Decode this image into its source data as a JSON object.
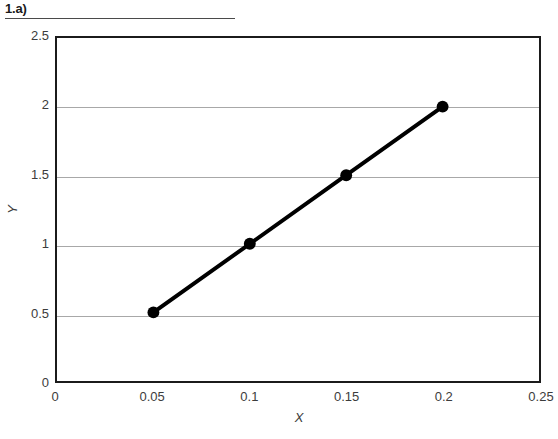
{
  "header": {
    "label": "1.a)"
  },
  "chart_data": {
    "type": "line",
    "title": "",
    "xlabel": "X",
    "ylabel": "Y",
    "x": [
      0.05,
      0.1,
      0.15,
      0.2
    ],
    "values": [
      0.5,
      1,
      1.5,
      2
    ],
    "series": [
      {
        "name": "",
        "x": [
          0.05,
          0.1,
          0.15,
          0.2
        ],
        "values": [
          0.5,
          1,
          1.5,
          2
        ]
      }
    ],
    "xlim": [
      0,
      0.25
    ],
    "ylim": [
      0,
      2.5
    ],
    "xticks": [
      0,
      0.05,
      0.1,
      0.15,
      0.2,
      0.25
    ],
    "xtick_labels": [
      "0",
      "0.05",
      "0.1",
      "0.15",
      "0.2",
      "0.25"
    ],
    "yticks": [
      0,
      0.5,
      1,
      1.5,
      2,
      2.5
    ],
    "ytick_labels": [
      "0",
      "0.5",
      "1",
      "1.5",
      "2",
      "2.5"
    ],
    "grid": "horizontal",
    "legend": "none",
    "marker": "filled-circle",
    "marker_color": "#000000",
    "line_color": "#000000",
    "line_width": 4,
    "gridline_color": "#a8a8a8",
    "frame_color": "#1b1b1b",
    "background_color": "#ffffff"
  }
}
